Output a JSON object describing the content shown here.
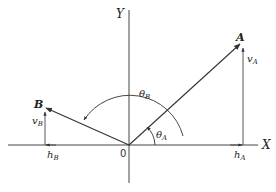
{
  "diagram": {
    "axes": {
      "x_label": "X",
      "y_label": "Y",
      "origin_label": "0"
    },
    "points": {
      "A": {
        "label": "A",
        "angle_label": "θ",
        "angle_sub": "A",
        "vertical_label": "v",
        "vertical_sub": "A",
        "horizontal_label": "h",
        "horizontal_sub": "A"
      },
      "B": {
        "label": "B",
        "angle_label": "θ",
        "angle_sub": "B",
        "vertical_label": "v",
        "vertical_sub": "B",
        "horizontal_label": "h",
        "horizontal_sub": "B"
      }
    },
    "colors": {
      "line": "#333333",
      "background": "#ffffff"
    }
  }
}
